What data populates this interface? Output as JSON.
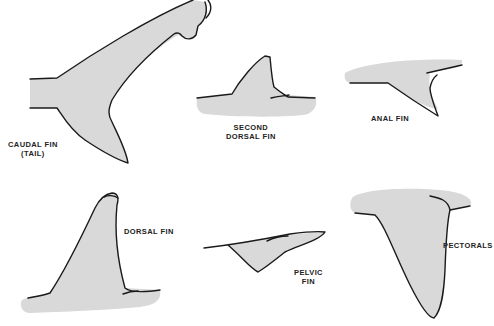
{
  "diagram": {
    "fill_color": "#d9d9d9",
    "outline_color": "#1a1a1a",
    "fins": [
      {
        "id": "caudal",
        "label_line1": "CAUDAL FIN",
        "label_line2": "(TAIL)"
      },
      {
        "id": "second-dorsal",
        "label_line1": "SECOND",
        "label_line2": "DORSAL FIN"
      },
      {
        "id": "anal",
        "label_line1": "ANAL FIN"
      },
      {
        "id": "dorsal",
        "label_line1": "DORSAL FIN"
      },
      {
        "id": "pelvic",
        "label_line1": "PELVIC",
        "label_line2": "FIN"
      },
      {
        "id": "pectoral",
        "label_line1": "PECTORALS"
      }
    ]
  }
}
